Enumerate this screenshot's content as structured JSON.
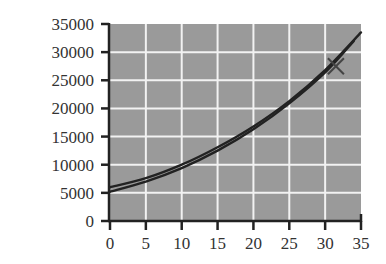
{
  "chart_data": {
    "type": "line",
    "title": "",
    "xlabel": "",
    "ylabel": "",
    "xlim": [
      0,
      35
    ],
    "ylim": [
      0,
      35000
    ],
    "x_ticks": [
      0,
      5,
      10,
      15,
      20,
      25,
      30,
      35
    ],
    "y_ticks": [
      0,
      5000,
      10000,
      15000,
      20000,
      25000,
      30000,
      35000
    ],
    "x_tick_labels": [
      "0",
      "5",
      "10",
      "15",
      "20",
      "25",
      "30",
      "35"
    ],
    "y_tick_labels": [
      "0",
      "5000",
      "10000",
      "15000",
      "20000",
      "25000",
      "30000",
      "35000"
    ],
    "grid": true,
    "legend": null,
    "background_color": "#9a9a9a",
    "grid_color": "#f2f2f2",
    "line_color": "#222222",
    "series": [
      {
        "name": "curve-upper",
        "x": [
          0,
          5,
          10,
          15,
          20,
          25,
          30,
          35
        ],
        "y": [
          6000,
          7600,
          10000,
          13100,
          16800,
          21300,
          26800,
          33500
        ]
      },
      {
        "name": "curve-lower",
        "x": [
          0,
          5,
          10,
          15,
          20,
          25,
          30,
          34
        ],
        "y": [
          5200,
          7000,
          9400,
          12500,
          16300,
          20900,
          26400,
          32000
        ]
      }
    ],
    "annotations": [
      {
        "type": "x-marker",
        "x": 31.5,
        "y": 27500
      }
    ]
  }
}
